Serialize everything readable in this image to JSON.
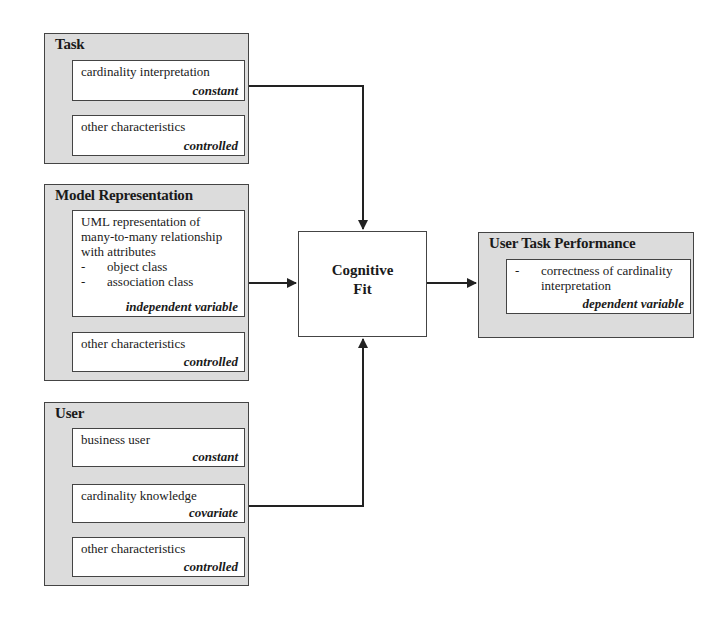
{
  "diagram": {
    "groups": {
      "task": {
        "title": "Task",
        "items": [
          {
            "desc": "cardinality interpretation",
            "tag": "constant"
          },
          {
            "desc": "other characteristics",
            "tag": "controlled"
          }
        ]
      },
      "model": {
        "title": "Model Representation",
        "items": [
          {
            "desc_lines": [
              "UML representation of",
              "many-to-many relationship",
              "with attributes"
            ],
            "bullets": [
              "object class",
              "association class"
            ],
            "bullet_marker": "-",
            "tag": "independent variable"
          },
          {
            "desc": "other characteristics",
            "tag": "controlled"
          }
        ]
      },
      "user": {
        "title": "User",
        "items": [
          {
            "desc": "business user",
            "tag": "constant"
          },
          {
            "desc": "cardinality knowledge",
            "tag": "covariate"
          },
          {
            "desc": "other characteristics",
            "tag": "controlled"
          }
        ]
      },
      "performance": {
        "title": "User Task Performance",
        "items": [
          {
            "bullet_marker": "-",
            "desc_lines": [
              "correctness of cardinality",
              "interpretation"
            ],
            "tag": "dependent variable"
          }
        ]
      }
    },
    "center": {
      "line1": "Cognitive",
      "line2": "Fit"
    },
    "edges": [
      {
        "from": "Task: cardinality interpretation",
        "to": "Cognitive Fit"
      },
      {
        "from": "Model Representation: UML representation",
        "to": "Cognitive Fit"
      },
      {
        "from": "User: cardinality knowledge",
        "to": "Cognitive Fit"
      },
      {
        "from": "Cognitive Fit",
        "to": "User Task Performance"
      }
    ],
    "colors": {
      "group_fill": "#dcdcdc",
      "item_fill": "#ffffff",
      "stroke": "#444444"
    }
  }
}
